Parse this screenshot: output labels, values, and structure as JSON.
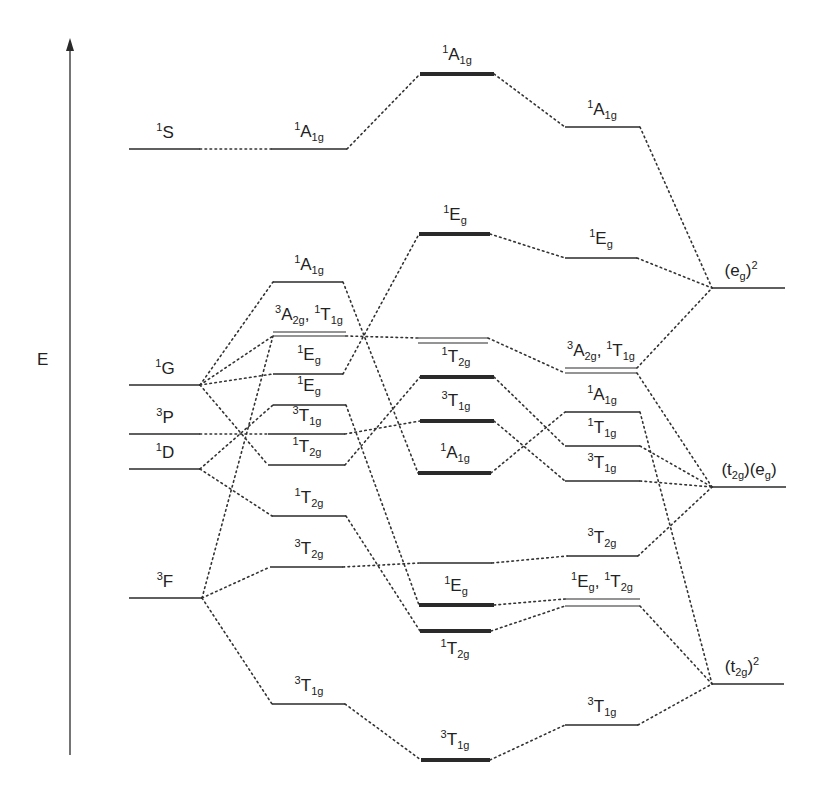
{
  "axis": {
    "label": "E",
    "x": 70,
    "y_top": 38,
    "y_bottom": 755,
    "label_x": 37,
    "label_y": 350
  },
  "colors": {
    "line": "#2a2a2a",
    "dotted": "#333333"
  },
  "columns": [
    "free-ion",
    "weak-field",
    "intermediate",
    "strong-field-terms",
    "strong-field-configs"
  ],
  "levels": [
    {
      "id": "L1S",
      "x1": 129,
      "x2": 200,
      "y": 149,
      "w": 1.5,
      "label": [
        [
          "sup",
          "1"
        ],
        [
          "t",
          "S"
        ]
      ],
      "lx": 165,
      "ly": 124
    },
    {
      "id": "L1G",
      "x1": 129,
      "x2": 200,
      "y": 385,
      "w": 1.5,
      "label": [
        [
          "sup",
          "1"
        ],
        [
          "t",
          "G"
        ]
      ],
      "lx": 165,
      "ly": 360
    },
    {
      "id": "L3P",
      "x1": 129,
      "x2": 200,
      "y": 434,
      "w": 1.5,
      "label": [
        [
          "sup",
          "3"
        ],
        [
          "t",
          "P"
        ]
      ],
      "lx": 165,
      "ly": 409
    },
    {
      "id": "L1D",
      "x1": 129,
      "x2": 200,
      "y": 469,
      "w": 1.5,
      "label": [
        [
          "sup",
          "1"
        ],
        [
          "t",
          "D"
        ]
      ],
      "lx": 165,
      "ly": 444
    },
    {
      "id": "L3F",
      "x1": 129,
      "x2": 202,
      "y": 598,
      "w": 1.5,
      "label": [
        [
          "sup",
          "3"
        ],
        [
          "t",
          "F"
        ]
      ],
      "lx": 165,
      "ly": 573
    },
    {
      "id": "W1A1g_top",
      "x1": 271,
      "x2": 347,
      "y": 149,
      "w": 1.5,
      "label": [
        [
          "sup",
          "1"
        ],
        [
          "t",
          "A"
        ],
        [
          "sub",
          "1g"
        ]
      ],
      "lx": 309,
      "ly": 123
    },
    {
      "id": "W1A1g",
      "x1": 273,
      "x2": 343,
      "y": 282,
      "w": 1.5,
      "label": [
        [
          "sup",
          "1"
        ],
        [
          "t",
          "A"
        ],
        [
          "sub",
          "1g"
        ]
      ],
      "lx": 309,
      "ly": 256
    },
    {
      "id": "W3A2g_a",
      "x1": 273,
      "x2": 346,
      "y": 332,
      "w": 1.2,
      "label": [
        [
          "sup",
          "3"
        ],
        [
          "t",
          "A"
        ],
        [
          "sub",
          "2g"
        ],
        [
          "t",
          ", "
        ],
        [
          "sup",
          "1"
        ],
        [
          "t",
          "T"
        ],
        [
          "sub",
          "1g"
        ]
      ],
      "lx": 309,
      "ly": 306
    },
    {
      "id": "W3A2g_b",
      "x1": 273,
      "x2": 346,
      "y": 336,
      "w": 1.2,
      "label": null
    },
    {
      "id": "W1Eg_a",
      "x1": 273,
      "x2": 343,
      "y": 374,
      "w": 1.5,
      "label": [
        [
          "sup",
          "1"
        ],
        [
          "t",
          "E"
        ],
        [
          "sub",
          "g"
        ]
      ],
      "lx": 309,
      "ly": 346
    },
    {
      "id": "W1Eg_b",
      "x1": 273,
      "x2": 346,
      "y": 405,
      "w": 1.5,
      "label": [
        [
          "sup",
          "1"
        ],
        [
          "t",
          "E"
        ],
        [
          "sub",
          "g"
        ]
      ],
      "lx": 309,
      "ly": 377
    },
    {
      "id": "W3T1g",
      "x1": 268,
      "x2": 345,
      "y": 434,
      "w": 1.5,
      "label": [
        [
          "sup",
          "3"
        ],
        [
          "t",
          "T"
        ],
        [
          "sub",
          "1g"
        ]
      ],
      "lx": 307,
      "ly": 407
    },
    {
      "id": "W1T2g_a",
      "x1": 268,
      "x2": 345,
      "y": 465,
      "w": 1.5,
      "label": [
        [
          "sup",
          "1"
        ],
        [
          "t",
          "T"
        ],
        [
          "sub",
          "2g"
        ]
      ],
      "lx": 307,
      "ly": 438
    },
    {
      "id": "W1T2g_b",
      "x1": 272,
      "x2": 346,
      "y": 516,
      "w": 1.5,
      "label": [
        [
          "sup",
          "1"
        ],
        [
          "t",
          "T"
        ],
        [
          "sub",
          "2g"
        ]
      ],
      "lx": 309,
      "ly": 489
    },
    {
      "id": "W3T2g",
      "x1": 270,
      "x2": 343,
      "y": 567,
      "w": 1.5,
      "label": [
        [
          "sup",
          "3"
        ],
        [
          "t",
          "T"
        ],
        [
          "sub",
          "2g"
        ]
      ],
      "lx": 309,
      "ly": 540
    },
    {
      "id": "W3T1g_low",
      "x1": 272,
      "x2": 345,
      "y": 704,
      "w": 1.5,
      "label": [
        [
          "sup",
          "3"
        ],
        [
          "t",
          "T"
        ],
        [
          "sub",
          "1g"
        ]
      ],
      "lx": 309,
      "ly": 677
    },
    {
      "id": "C1A1g_top",
      "x1": 420,
      "x2": 494,
      "y": 74,
      "w": 4,
      "label": [
        [
          "sup",
          "1"
        ],
        [
          "t",
          "A"
        ],
        [
          "sub",
          "1g"
        ]
      ],
      "lx": 457,
      "ly": 46
    },
    {
      "id": "C1Eg_top",
      "x1": 419,
      "x2": 490,
      "y": 234,
      "w": 4,
      "label": [
        [
          "sup",
          "1"
        ],
        [
          "t",
          "E"
        ],
        [
          "sub",
          "g"
        ]
      ],
      "lx": 455,
      "ly": 206
    },
    {
      "id": "C_dbl_a",
      "x1": 418,
      "x2": 488,
      "y": 338,
      "w": 1.2,
      "label": null
    },
    {
      "id": "C_dbl_b",
      "x1": 418,
      "x2": 488,
      "y": 343,
      "w": 1.2,
      "label": null
    },
    {
      "id": "C1T2g",
      "x1": 420,
      "x2": 494,
      "y": 377,
      "w": 4,
      "label": [
        [
          "sup",
          "1"
        ],
        [
          "t",
          "T"
        ],
        [
          "sub",
          "2g"
        ]
      ],
      "lx": 456,
      "ly": 348
    },
    {
      "id": "C3T1g",
      "x1": 420,
      "x2": 494,
      "y": 421,
      "w": 4,
      "label": [
        [
          "sup",
          "3"
        ],
        [
          "t",
          "T"
        ],
        [
          "sub",
          "1g"
        ]
      ],
      "lx": 456,
      "ly": 392
    },
    {
      "id": "C1A1g",
      "x1": 418,
      "x2": 491,
      "y": 473,
      "w": 4,
      "label": [
        [
          "sup",
          "1"
        ],
        [
          "t",
          "A"
        ],
        [
          "sub",
          "1g"
        ]
      ],
      "lx": 455,
      "ly": 444
    },
    {
      "id": "C_thin",
      "x1": 420,
      "x2": 492,
      "y": 563,
      "w": 1.5,
      "label": null
    },
    {
      "id": "C1Eg",
      "x1": 419,
      "x2": 494,
      "y": 605,
      "w": 4,
      "label": [
        [
          "sup",
          "1"
        ],
        [
          "t",
          "E"
        ],
        [
          "sub",
          "g"
        ]
      ],
      "lx": 456,
      "ly": 577
    },
    {
      "id": "C1T2g_low",
      "x1": 420,
      "x2": 491,
      "y": 631,
      "w": 4,
      "label": [
        [
          "sup",
          "1"
        ],
        [
          "t",
          "T"
        ],
        [
          "sub",
          "2g"
        ]
      ],
      "lx": 455,
      "ly": 640
    },
    {
      "id": "C3T1g_low",
      "x1": 421,
      "x2": 490,
      "y": 760,
      "w": 4,
      "label": [
        [
          "sup",
          "3"
        ],
        [
          "t",
          "T"
        ],
        [
          "sub",
          "1g"
        ]
      ],
      "lx": 455,
      "ly": 731
    },
    {
      "id": "R1A1g_top",
      "x1": 565,
      "x2": 640,
      "y": 127,
      "w": 1.5,
      "label": [
        [
          "sup",
          "1"
        ],
        [
          "t",
          "A"
        ],
        [
          "sub",
          "1g"
        ]
      ],
      "lx": 602,
      "ly": 101
    },
    {
      "id": "R1Eg",
      "x1": 565,
      "x2": 637,
      "y": 258,
      "w": 1.5,
      "label": [
        [
          "sup",
          "1"
        ],
        [
          "t",
          "E"
        ],
        [
          "sub",
          "g"
        ]
      ],
      "lx": 601,
      "ly": 230
    },
    {
      "id": "R3A2g_a",
      "x1": 565,
      "x2": 637,
      "y": 368,
      "w": 1.2,
      "label": [
        [
          "sup",
          "3"
        ],
        [
          "t",
          "A"
        ],
        [
          "sub",
          "2g"
        ],
        [
          "t",
          ", "
        ],
        [
          "sup",
          "1"
        ],
        [
          "t",
          "T"
        ],
        [
          "sub",
          "1g"
        ]
      ],
      "lx": 601,
      "ly": 342
    },
    {
      "id": "R3A2g_b",
      "x1": 565,
      "x2": 637,
      "y": 373,
      "w": 1.2,
      "label": null
    },
    {
      "id": "R1A1g",
      "x1": 565,
      "x2": 640,
      "y": 412,
      "w": 1.5,
      "label": [
        [
          "sup",
          "1"
        ],
        [
          "t",
          "A"
        ],
        [
          "sub",
          "1g"
        ]
      ],
      "lx": 602,
      "ly": 386
    },
    {
      "id": "R1T1g",
      "x1": 565,
      "x2": 640,
      "y": 446,
      "w": 1.5,
      "label": [
        [
          "sup",
          "1"
        ],
        [
          "t",
          "T"
        ],
        [
          "sub",
          "1g"
        ]
      ],
      "lx": 602,
      "ly": 419
    },
    {
      "id": "R3T1g",
      "x1": 565,
      "x2": 640,
      "y": 481,
      "w": 1.5,
      "label": [
        [
          "sup",
          "3"
        ],
        [
          "t",
          "T"
        ],
        [
          "sub",
          "1g"
        ]
      ],
      "lx": 602,
      "ly": 454
    },
    {
      "id": "R3T2g",
      "x1": 567,
      "x2": 638,
      "y": 556,
      "w": 1.5,
      "label": [
        [
          "sup",
          "3"
        ],
        [
          "t",
          "T"
        ],
        [
          "sub",
          "2g"
        ]
      ],
      "lx": 602,
      "ly": 529
    },
    {
      "id": "R_dbl_a",
      "x1": 565,
      "x2": 640,
      "y": 599,
      "w": 1.2,
      "label": [
        [
          "sup",
          "1"
        ],
        [
          "t",
          "E"
        ],
        [
          "sub",
          "g"
        ],
        [
          "t",
          ", "
        ],
        [
          "sup",
          "1"
        ],
        [
          "t",
          "T"
        ],
        [
          "sub",
          "2g"
        ]
      ],
      "lx": 602,
      "ly": 573
    },
    {
      "id": "R_dbl_b",
      "x1": 565,
      "x2": 640,
      "y": 606,
      "w": 1.2,
      "label": null
    },
    {
      "id": "R3T1g_low",
      "x1": 565,
      "x2": 638,
      "y": 725,
      "w": 1.5,
      "label": [
        [
          "sup",
          "3"
        ],
        [
          "t",
          "T"
        ],
        [
          "sub",
          "1g"
        ]
      ],
      "lx": 602,
      "ly": 698
    },
    {
      "id": "Feg2",
      "x1": 712,
      "x2": 785,
      "y": 288,
      "w": 1.5,
      "label": [
        [
          "t",
          "(e"
        ],
        [
          "sub",
          "g"
        ],
        [
          "t",
          ")"
        ],
        [
          "sup",
          "2"
        ]
      ],
      "lx": 741,
      "ly": 262
    },
    {
      "id": "Ft2geg",
      "x1": 712,
      "x2": 786,
      "y": 487,
      "w": 1.5,
      "label": [
        [
          "t",
          "(t"
        ],
        [
          "sub",
          "2g"
        ],
        [
          "t",
          ")(e"
        ],
        [
          "sub",
          "g"
        ],
        [
          "t",
          ")"
        ]
      ],
      "lx": 749,
      "ly": 461
    },
    {
      "id": "Ft2g2",
      "x1": 712,
      "x2": 784,
      "y": 684,
      "w": 1.5,
      "label": [
        [
          "t",
          "(t"
        ],
        [
          "sub",
          "2g"
        ],
        [
          "t",
          ")"
        ],
        [
          "sup",
          "2"
        ]
      ],
      "lx": 742,
      "ly": 658
    }
  ],
  "connections": [
    [
      "L1S",
      "W1A1g_top"
    ],
    [
      "L1G",
      "W1A1g"
    ],
    [
      "L1G",
      "W3A2g_b"
    ],
    [
      "L1G",
      "W1Eg_a"
    ],
    [
      "L1G",
      "W1T2g_a"
    ],
    [
      "L3P",
      "W3T1g"
    ],
    [
      "L1D",
      "W1Eg_b"
    ],
    [
      "L1D",
      "W1T2g_b"
    ],
    [
      "L3F",
      "W3A2g_b"
    ],
    [
      "L3F",
      "W3T2g"
    ],
    [
      "L3F",
      "W3T1g_low"
    ],
    [
      "W1A1g_top",
      "C1A1g_top"
    ],
    [
      "W1A1g",
      "C1A1g"
    ],
    [
      "W3A2g_b",
      "C_dbl_a"
    ],
    [
      "W1Eg_a",
      "C1Eg_top"
    ],
    [
      "W1Eg_b",
      "C1Eg"
    ],
    [
      "W3T1g",
      "C3T1g"
    ],
    [
      "W1T2g_a",
      "C1T2g"
    ],
    [
      "W1T2g_b",
      "C1T2g_low"
    ],
    [
      "W3T2g",
      "C_thin"
    ],
    [
      "W3T1g_low",
      "C3T1g_low"
    ],
    [
      "C1A1g_top",
      "R1A1g_top"
    ],
    [
      "C1Eg_top",
      "R1Eg"
    ],
    [
      "C_dbl_a",
      "R3A2g_b"
    ],
    [
      "C1T2g",
      "R1T1g"
    ],
    [
      "C3T1g",
      "R3T1g"
    ],
    [
      "C1A1g",
      "R1A1g"
    ],
    [
      "C_thin",
      "R3T2g"
    ],
    [
      "C1Eg",
      "R_dbl_a"
    ],
    [
      "C1T2g_low",
      "R_dbl_b"
    ],
    [
      "C3T1g_low",
      "R3T1g_low"
    ],
    [
      "R1A1g_top",
      "Feg2"
    ],
    [
      "R1Eg",
      "Feg2"
    ],
    [
      "R3A2g_a",
      "Feg2"
    ],
    [
      "R3A2g_b",
      "Ft2geg"
    ],
    [
      "R1T1g",
      "Ft2geg"
    ],
    [
      "R3T1g",
      "Ft2geg"
    ],
    [
      "R3T2g",
      "Ft2geg"
    ],
    [
      "R1A1g",
      "Ft2g2"
    ],
    [
      "R_dbl_b",
      "Ft2g2"
    ],
    [
      "R3T1g_low",
      "Ft2g2"
    ]
  ]
}
